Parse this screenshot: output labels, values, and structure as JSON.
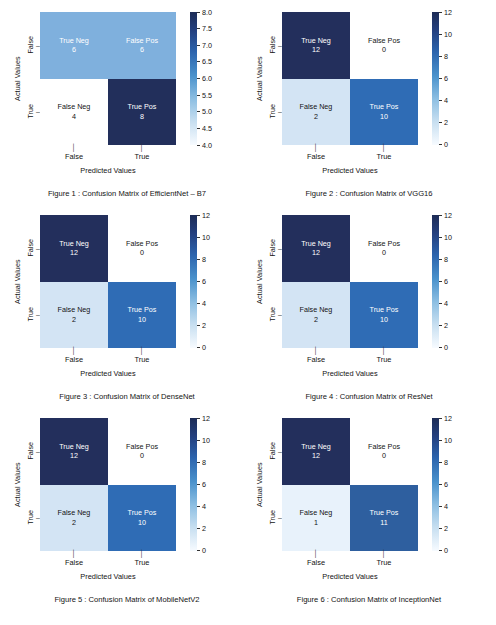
{
  "chart_data": [
    {
      "type": "heatmap",
      "title": "Figure 1 : Confusion Matrix of EfficientNet – B7",
      "xlabel": "Predicted Values",
      "ylabel": "Actual Values",
      "xticklabels": [
        "False",
        "True"
      ],
      "yticklabels": [
        "False",
        "True"
      ],
      "categories": [
        "False",
        "True"
      ],
      "cells": [
        [
          {
            "label": "True Neg",
            "value": "6",
            "color": "#7fb0dd",
            "text_color": "#ffffff"
          },
          {
            "label": "False Pos",
            "value": "6",
            "color": "#7fb0dd",
            "text_color": "#ffffff"
          }
        ],
        [
          {
            "label": "False Neg",
            "value": "4",
            "color": "#ffffff",
            "text_color": "#131313"
          },
          {
            "label": "True Pos",
            "value": "8",
            "color": "#222f5b",
            "text_color": "#ffffff"
          }
        ]
      ],
      "values": [
        [
          6,
          6
        ],
        [
          4,
          8
        ]
      ],
      "colorbar": {
        "ticks": [
          "8.0",
          "7.5",
          "7.0",
          "6.5",
          "6.0",
          "5.5",
          "5.0",
          "4.5",
          "4.0"
        ],
        "min": 4.0,
        "max": 8.0,
        "gradient": "linear-gradient(to bottom, #1d2c56 0%, #24407f 14%, #2c64ad 30%, #4a92cc 48%, #8fc0e3 66%, #c6def0 82%, #f7fbff 100%)"
      },
      "grid": false,
      "legend": "colorbar-right"
    },
    {
      "type": "heatmap",
      "title": "Figure 2 : Confusion Matrix of VGG16",
      "xlabel": "Predicted Values",
      "ylabel": "Actual Values",
      "xticklabels": [
        "False",
        "True"
      ],
      "yticklabels": [
        "False",
        "True"
      ],
      "categories": [
        "False",
        "True"
      ],
      "cells": [
        [
          {
            "label": "True Neg",
            "value": "12",
            "color": "#232f5c",
            "text_color": "#ffffff"
          },
          {
            "label": "False Pos",
            "value": "0",
            "color": "#ffffff",
            "text_color": "#131313"
          }
        ],
        [
          {
            "label": "False Neg",
            "value": "2",
            "color": "#d3e4f4",
            "text_color": "#131313"
          },
          {
            "label": "True Pos",
            "value": "10",
            "color": "#2f6cb5",
            "text_color": "#ffffff"
          }
        ]
      ],
      "values": [
        [
          12,
          0
        ],
        [
          2,
          10
        ]
      ],
      "colorbar": {
        "ticks": [
          "12",
          "10",
          "8",
          "6",
          "4",
          "2",
          "0"
        ],
        "min": 0,
        "max": 12,
        "gradient": "linear-gradient(to bottom, #1d2c56 0%, #24407f 14%, #2c64ad 30%, #4a92cc 48%, #8fc0e3 66%, #c6def0 82%, #f7fbff 100%)"
      },
      "grid": false,
      "legend": "colorbar-right"
    },
    {
      "type": "heatmap",
      "title": "Figure 3 : Confusion Matrix of DenseNet",
      "xlabel": "Predicted Values",
      "ylabel": "Actual Values",
      "xticklabels": [
        "False",
        "True"
      ],
      "yticklabels": [
        "False",
        "True"
      ],
      "categories": [
        "False",
        "True"
      ],
      "cells": [
        [
          {
            "label": "True Neg",
            "value": "12",
            "color": "#232f5c",
            "text_color": "#ffffff"
          },
          {
            "label": "False Pos",
            "value": "0",
            "color": "#ffffff",
            "text_color": "#131313"
          }
        ],
        [
          {
            "label": "False Neg",
            "value": "2",
            "color": "#d3e4f4",
            "text_color": "#131313"
          },
          {
            "label": "True Pos",
            "value": "10",
            "color": "#2f6cb5",
            "text_color": "#ffffff"
          }
        ]
      ],
      "values": [
        [
          12,
          0
        ],
        [
          2,
          10
        ]
      ],
      "colorbar": {
        "ticks": [
          "12",
          "10",
          "8",
          "6",
          "4",
          "2",
          "0"
        ],
        "min": 0,
        "max": 12,
        "gradient": "linear-gradient(to bottom, #1d2c56 0%, #24407f 14%, #2c64ad 30%, #4a92cc 48%, #8fc0e3 66%, #c6def0 82%, #f7fbff 100%)"
      },
      "grid": false,
      "legend": "colorbar-right"
    },
    {
      "type": "heatmap",
      "title": "Figure 4 : Confusion Matrix of ResNet",
      "xlabel": "Predicted Values",
      "ylabel": "Actual Values",
      "xticklabels": [
        "False",
        "True"
      ],
      "yticklabels": [
        "False",
        "True"
      ],
      "categories": [
        "False",
        "True"
      ],
      "cells": [
        [
          {
            "label": "True Neg",
            "value": "12",
            "color": "#232f5c",
            "text_color": "#ffffff"
          },
          {
            "label": "False Pos",
            "value": "0",
            "color": "#ffffff",
            "text_color": "#131313"
          }
        ],
        [
          {
            "label": "False Neg",
            "value": "2",
            "color": "#d3e4f4",
            "text_color": "#131313"
          },
          {
            "label": "True Pos",
            "value": "10",
            "color": "#2f6cb5",
            "text_color": "#ffffff"
          }
        ]
      ],
      "values": [
        [
          12,
          0
        ],
        [
          2,
          10
        ]
      ],
      "colorbar": {
        "ticks": [
          "12",
          "10",
          "8",
          "6",
          "4",
          "2",
          "0"
        ],
        "min": 0,
        "max": 12,
        "gradient": "linear-gradient(to bottom, #1d2c56 0%, #24407f 14%, #2c64ad 30%, #4a92cc 48%, #8fc0e3 66%, #c6def0 82%, #f7fbff 100%)"
      },
      "grid": false,
      "legend": "colorbar-right"
    },
    {
      "type": "heatmap",
      "title": "Figure 5 : Confusion Matrix of MobileNetV2",
      "xlabel": "Predicted Values",
      "ylabel": "Actual Values",
      "xticklabels": [
        "False",
        "True"
      ],
      "yticklabels": [
        "False",
        "True"
      ],
      "categories": [
        "False",
        "True"
      ],
      "cells": [
        [
          {
            "label": "True Neg",
            "value": "12",
            "color": "#232f5c",
            "text_color": "#ffffff"
          },
          {
            "label": "False Pos",
            "value": "0",
            "color": "#ffffff",
            "text_color": "#131313"
          }
        ],
        [
          {
            "label": "False Neg",
            "value": "2",
            "color": "#d3e4f4",
            "text_color": "#131313"
          },
          {
            "label": "True Pos",
            "value": "10",
            "color": "#2f6cb5",
            "text_color": "#ffffff"
          }
        ]
      ],
      "values": [
        [
          12,
          0
        ],
        [
          2,
          10
        ]
      ],
      "colorbar": {
        "ticks": [
          "12",
          "10",
          "8",
          "6",
          "4",
          "2",
          "0"
        ],
        "min": 0,
        "max": 12,
        "gradient": "linear-gradient(to bottom, #1d2c56 0%, #24407f 14%, #2c64ad 30%, #4a92cc 48%, #8fc0e3 66%, #c6def0 82%, #f7fbff 100%)"
      },
      "grid": false,
      "legend": "colorbar-right"
    },
    {
      "type": "heatmap",
      "title": "Figure 6 : Confusion Matrix of InceptionNet",
      "xlabel": "Predicted Values",
      "ylabel": "Actual Values",
      "xticklabels": [
        "False",
        "True"
      ],
      "yticklabels": [
        "False",
        "True"
      ],
      "categories": [
        "False",
        "True"
      ],
      "cells": [
        [
          {
            "label": "True Neg",
            "value": "12",
            "color": "#232f5c",
            "text_color": "#ffffff"
          },
          {
            "label": "False Pos",
            "value": "0",
            "color": "#ffffff",
            "text_color": "#131313"
          }
        ],
        [
          {
            "label": "False Neg",
            "value": "1",
            "color": "#e8f2fb",
            "text_color": "#131313"
          },
          {
            "label": "True Pos",
            "value": "11",
            "color": "#2e5f9f",
            "text_color": "#ffffff"
          }
        ]
      ],
      "values": [
        [
          12,
          0
        ],
        [
          1,
          11
        ]
      ],
      "colorbar": {
        "ticks": [
          "12",
          "10",
          "8",
          "6",
          "4",
          "2",
          "0"
        ],
        "min": 0,
        "max": 12,
        "gradient": "linear-gradient(to bottom, #1d2c56 0%, #24407f 14%, #2c64ad 30%, #4a92cc 48%, #8fc0e3 66%, #c6def0 82%, #f7fbff 100%)"
      },
      "grid": false,
      "legend": "colorbar-right"
    }
  ]
}
